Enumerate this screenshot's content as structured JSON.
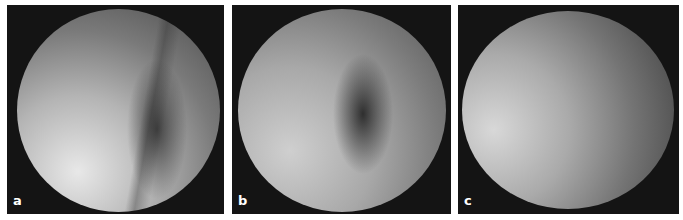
{
  "figure": {
    "panels": [
      {
        "id": "a",
        "label": "a",
        "description": "endoscopic view, bright lower-left, vertical dark fold at center-right"
      },
      {
        "id": "b",
        "label": "b",
        "description": "endoscopic view, dark central recess with angled ridge"
      },
      {
        "id": "c",
        "label": "c",
        "description": "endoscopic view, smooth dome, bright left side darkening to right"
      }
    ],
    "colors": {
      "frame": "#141414",
      "background": "#ffffff",
      "label": "#ffffff"
    }
  }
}
